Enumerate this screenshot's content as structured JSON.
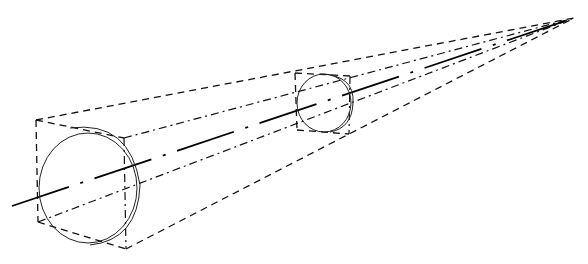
{
  "diagram": {
    "type": "perspective-construction",
    "vanishing_point": {
      "x": 574,
      "y": 18
    },
    "near_box": {
      "front_top_left": [
        36,
        120
      ],
      "front_bottom_left": [
        38,
        222
      ],
      "back_top": [
        124,
        138
      ],
      "back_bottom": [
        126,
        249
      ]
    },
    "near_circle": {
      "cx": 88,
      "cy": 188,
      "rx": 49,
      "ry": 55
    },
    "near_back_arc": {
      "cx": 95,
      "cy": 185,
      "rx": 46,
      "ry": 54
    },
    "far_box": {
      "tl": [
        295,
        73
      ],
      "tr": [
        350,
        76
      ],
      "bl": [
        297,
        130
      ],
      "br": [
        349,
        134
      ]
    },
    "far_circle": {
      "cx": 325,
      "cy": 103,
      "rx": 28,
      "ry": 30
    },
    "axis_start": [
      12,
      206
    ],
    "colors": {
      "background": "#ffffff",
      "ink": "#111111"
    }
  }
}
